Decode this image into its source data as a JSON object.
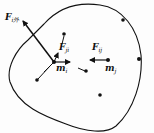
{
  "diagram": {
    "title": "",
    "boundary": "closed-curve system boundary",
    "labels": {
      "external_force": {
        "main": "F",
        "sub": "i外"
      },
      "internal_force_ji": {
        "main": "F",
        "sub": "ji"
      },
      "internal_force_ij": {
        "main": "F",
        "sub": "ij"
      },
      "mass_i": {
        "main": "m",
        "sub": "i"
      },
      "mass_j": {
        "main": "m",
        "sub": "j"
      }
    },
    "particles": [
      {
        "id": "m_i",
        "x": 54,
        "y": 62
      },
      {
        "id": "m_j",
        "x": 108,
        "y": 60
      },
      {
        "id": "p1",
        "x": 64,
        "y": 34
      },
      {
        "id": "p2",
        "x": 123,
        "y": 20
      },
      {
        "id": "p3",
        "x": 139,
        "y": 59
      },
      {
        "id": "p4",
        "x": 37,
        "y": 80
      },
      {
        "id": "p5",
        "x": 100,
        "y": 95
      },
      {
        "id": "p6",
        "x": 85,
        "y": 71
      }
    ],
    "colors": {
      "ink": "#111111",
      "background": "#fdfdfd"
    }
  }
}
